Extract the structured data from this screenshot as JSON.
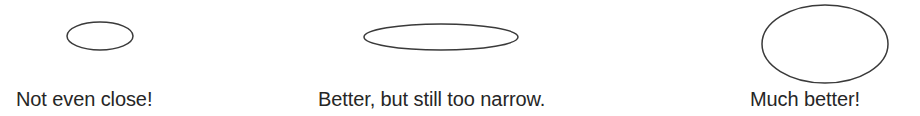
{
  "figure": {
    "background_color": "#ffffff",
    "width": 920,
    "height": 116,
    "stroke_color": "#3a3a3a",
    "text_color": "#262626"
  },
  "panels": [
    {
      "id": "panel-1",
      "shape_name": "ellipse-small-flat",
      "caption": "Not even close!",
      "ellipse": {
        "cx": 100,
        "cy": 36,
        "rx": 33,
        "ry": 14
      }
    },
    {
      "id": "panel-2",
      "shape_name": "ellipse-wide-flat",
      "caption": "Better, but still too narrow.",
      "ellipse": {
        "cx": 441,
        "cy": 37,
        "rx": 77,
        "ry": 13
      }
    },
    {
      "id": "panel-3",
      "shape_name": "ellipse-large-round",
      "caption": "Much better!",
      "ellipse": {
        "cx": 825,
        "cy": 44,
        "rx": 63,
        "ry": 39
      }
    }
  ]
}
